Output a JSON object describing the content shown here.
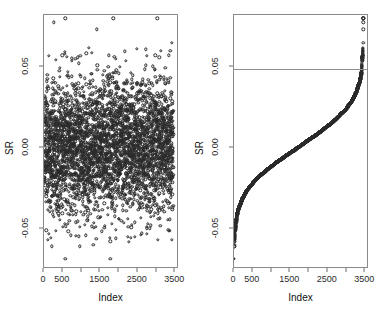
{
  "figure": {
    "width": 381,
    "height": 321,
    "background": "#ffffff",
    "point_color": "#2b2b2b",
    "axis_color": "#8a8a8a",
    "refline_color": "#8f8f8f"
  },
  "chart_data": [
    {
      "type": "scatter",
      "panel": "left",
      "title": "",
      "xlabel": "Index",
      "ylabel": "SR",
      "xlim": [
        0,
        3600
      ],
      "ylim": [
        -0.075,
        0.082
      ],
      "xticks": [
        0,
        500,
        1000,
        1500,
        2000,
        2500,
        3000,
        3500
      ],
      "xticklabels": [
        "0",
        "500",
        "",
        "1500",
        "",
        "2500",
        "",
        "3500"
      ],
      "yticks": [
        -0.05,
        0.0,
        0.05
      ],
      "yticklabels": [
        "-0.05",
        "0.00",
        "0.05"
      ],
      "grid": false,
      "legend": null,
      "marker": "open-circle",
      "n_points": 3500,
      "description": "Studentized residuals plotted against observation index; dense cloud centred near 0.00 spanning roughly -0.06 to 0.06 with sparse outliers up to 0.08.",
      "summary": {
        "center": 0.0,
        "bulk_min": -0.055,
        "bulk_max": 0.052,
        "outlier_max": 0.079,
        "outlier_min": -0.068
      }
    },
    {
      "type": "scatter",
      "panel": "right",
      "title": "",
      "xlabel": "Index",
      "ylabel": "SR",
      "xlim": [
        0,
        3600
      ],
      "ylim": [
        -0.075,
        0.082
      ],
      "xticks": [
        0,
        500,
        1000,
        1500,
        2000,
        2500,
        3000,
        3500
      ],
      "xticklabels": [
        "0",
        "500",
        "",
        "1500",
        "",
        "2500",
        "",
        "3500"
      ],
      "yticks": [
        -0.05,
        0.0,
        0.05
      ],
      "yticklabels": [
        "-0.05",
        "0.00",
        "0.05"
      ],
      "grid": false,
      "legend": null,
      "marker": "open-circle",
      "n_points": 3500,
      "description": "Same studentized residuals sorted in increasing order, forming a monotone ogive curve; a horizontal reference line marks the upper cutoff.",
      "reference_line": {
        "orientation": "horizontal",
        "value": 0.0486,
        "label": ""
      }
    }
  ]
}
